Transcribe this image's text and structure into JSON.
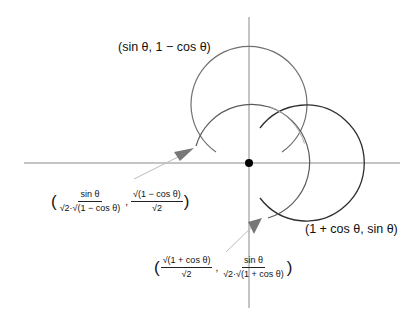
{
  "labels": {
    "top_circle": "(sin θ, 1 − cos θ)",
    "right_circle": "(1 + cos θ, sin θ)"
  },
  "left_point": {
    "x_num": "sin θ",
    "x_den": "√2·√(1 − cos θ)",
    "y_num": "√(1 − cos θ)",
    "y_den": "√2"
  },
  "bottom_point": {
    "x_num": "√(1 + cos θ)",
    "x_den": "√2",
    "y_num": "sin θ",
    "y_den": "√2·√(1 + cos θ)"
  },
  "punct": {
    "open": "(",
    "close": ")",
    "comma": ","
  },
  "colors": {
    "axis": "#8a8a8a",
    "top_circle": "#6f6f6f",
    "middle_circle": "#5a5a5a",
    "right_circle": "#2e2e2e",
    "arrow": "#777777",
    "origin_dot": "#000000"
  }
}
